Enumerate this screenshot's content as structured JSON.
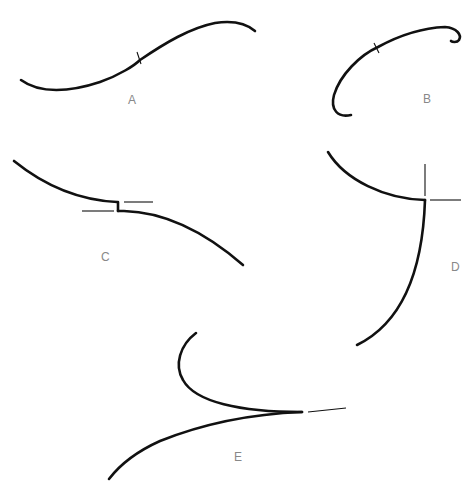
{
  "figure": {
    "panels": [
      {
        "id": "A",
        "label": "A",
        "description": "S-shaped smooth curve with a short transverse tick mark at its midpoint"
      },
      {
        "id": "B",
        "label": "B",
        "description": "Arc curving up and right, ending in a small hook, with a tick mark on the arc"
      },
      {
        "id": "C",
        "label": "C",
        "description": "Curve with a small vertical step discontinuity; two horizontal tangent lines at the step"
      },
      {
        "id": "D",
        "label": "D",
        "description": "Two curve branches meeting at a corner point, with vertical and horizontal tangent lines"
      },
      {
        "id": "E",
        "label": "E",
        "description": "Cusp: two branches meeting tangentially at a point, with a tangent line extending beyond the cusp"
      }
    ],
    "colors": {
      "stroke": "#111111",
      "label": "#888888",
      "background": "#ffffff"
    }
  }
}
